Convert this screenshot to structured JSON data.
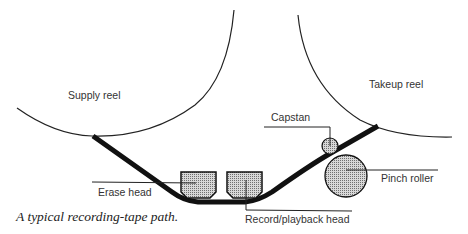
{
  "diagram": {
    "title": "Recording-tape path",
    "labels": {
      "supply_reel": "Supply reel",
      "takeup_reel": "Takeup reel",
      "capstan": "Capstan",
      "pinch_roller": "Pinch roller",
      "erase_head": "Erase head",
      "record_playback_head": "Record/playback head"
    },
    "caption": "A typical recording-tape path."
  }
}
